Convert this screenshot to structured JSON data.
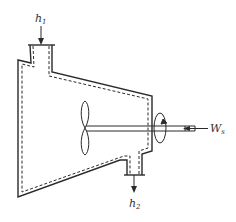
{
  "diagram": {
    "labels": {
      "inlet": {
        "main": "h",
        "sub": "1"
      },
      "outlet": {
        "main": "h",
        "sub": "2"
      },
      "work": {
        "main": "W",
        "sub": "s"
      }
    },
    "colors": {
      "line": "#2a2a2a",
      "background": "#ffffff"
    }
  }
}
